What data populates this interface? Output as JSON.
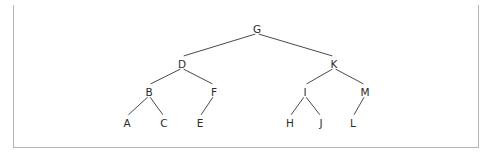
{
  "figure": {
    "kind": "binary-tree-diagram",
    "frame": {
      "x": 13,
      "y": 5,
      "width": 466,
      "height": 143,
      "border_color": "#b3b3b3",
      "top_rule_color": "#3c3c3c",
      "background": "#ffffff"
    },
    "style": {
      "edge_color": "#4a4a4a",
      "label_color": "#2b2b2b",
      "edge_width": 1,
      "font_size": 10.5
    }
  },
  "chart_data": {
    "type": "diagram",
    "title": "",
    "nodes": [
      {
        "id": "G",
        "label": "G",
        "x": 257,
        "y": 29,
        "depth": 0,
        "parent": null
      },
      {
        "id": "D",
        "label": "D",
        "x": 182,
        "y": 64,
        "depth": 1,
        "parent": "G",
        "side": "left"
      },
      {
        "id": "K",
        "label": "K",
        "x": 334,
        "y": 64,
        "depth": 1,
        "parent": "G",
        "side": "right"
      },
      {
        "id": "B",
        "label": "B",
        "x": 149,
        "y": 92,
        "depth": 2,
        "parent": "D",
        "side": "left"
      },
      {
        "id": "F",
        "label": "F",
        "x": 214,
        "y": 92,
        "depth": 2,
        "parent": "D",
        "side": "right"
      },
      {
        "id": "I",
        "label": "I",
        "x": 305,
        "y": 92,
        "depth": 2,
        "parent": "K",
        "side": "left"
      },
      {
        "id": "M",
        "label": "M",
        "x": 365,
        "y": 92,
        "depth": 2,
        "parent": "K",
        "side": "right"
      },
      {
        "id": "A",
        "label": "A",
        "x": 127,
        "y": 123,
        "depth": 3,
        "parent": "B",
        "side": "left"
      },
      {
        "id": "C",
        "label": "C",
        "x": 164,
        "y": 123,
        "depth": 3,
        "parent": "B",
        "side": "right"
      },
      {
        "id": "E",
        "label": "E",
        "x": 200,
        "y": 123,
        "depth": 3,
        "parent": "F",
        "side": "left"
      },
      {
        "id": "H",
        "label": "H",
        "x": 290,
        "y": 123,
        "depth": 3,
        "parent": "I",
        "side": "left"
      },
      {
        "id": "J",
        "label": "J",
        "x": 321,
        "y": 123,
        "depth": 3,
        "parent": "I",
        "side": "right"
      },
      {
        "id": "L",
        "label": "L",
        "x": 353,
        "y": 123,
        "depth": 3,
        "parent": "M",
        "side": "left"
      }
    ],
    "edges": [
      {
        "from": "G",
        "to": "D"
      },
      {
        "from": "G",
        "to": "K"
      },
      {
        "from": "D",
        "to": "B"
      },
      {
        "from": "D",
        "to": "F"
      },
      {
        "from": "K",
        "to": "I"
      },
      {
        "from": "K",
        "to": "M"
      },
      {
        "from": "B",
        "to": "A"
      },
      {
        "from": "B",
        "to": "C"
      },
      {
        "from": "F",
        "to": "E"
      },
      {
        "from": "I",
        "to": "H"
      },
      {
        "from": "I",
        "to": "J"
      },
      {
        "from": "M",
        "to": "L"
      }
    ]
  }
}
